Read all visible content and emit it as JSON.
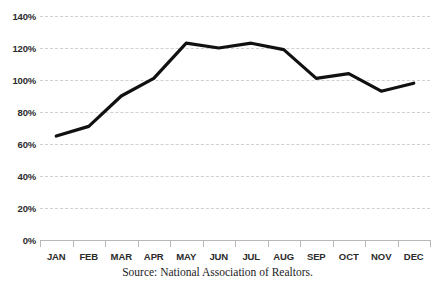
{
  "chart_data": {
    "type": "line",
    "title": "",
    "xlabel": "",
    "ylabel": "",
    "categories": [
      "JAN",
      "FEB",
      "MAR",
      "APR",
      "MAY",
      "JUN",
      "JUL",
      "AUG",
      "SEP",
      "OCT",
      "NOV",
      "DEC"
    ],
    "values": [
      65,
      71,
      90,
      101,
      123,
      120,
      123,
      119,
      101,
      104,
      93,
      98
    ],
    "ylim": [
      0,
      140
    ],
    "ytick_values": [
      0,
      20,
      40,
      60,
      80,
      100,
      120,
      140
    ],
    "ytick_labels": [
      "0%",
      "20%",
      "40%",
      "60%",
      "80%",
      "100%",
      "120%",
      "140%"
    ],
    "grid": true,
    "legend": false,
    "line_color": "#111111",
    "gridline_color": "#cfcfd4",
    "axis_color": "#b8b8bc",
    "caption": "Source: National Association of Realtors."
  }
}
